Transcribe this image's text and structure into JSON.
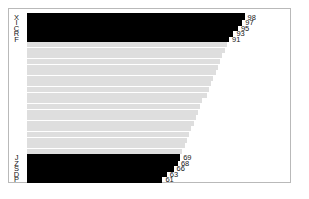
{
  "chart_data": {
    "type": "bar",
    "orientation": "horizontal",
    "title": "",
    "subtitle": "",
    "xlabel": "",
    "ylabel": "",
    "grid": false,
    "legend": null,
    "xlim": [
      0,
      98
    ],
    "categories": [
      "X",
      "I",
      "C",
      "R",
      "F",
      "J",
      "Z",
      "S",
      "D",
      "P"
    ],
    "values": [
      98,
      97,
      95,
      93,
      91,
      69,
      68,
      66,
      63,
      61
    ],
    "bars": [
      {
        "label": "X",
        "value": 98,
        "value_text": "98",
        "style": "solid"
      },
      {
        "label": "I",
        "value": 97,
        "value_text": "97",
        "style": "solid"
      },
      {
        "label": "C",
        "value": 95,
        "value_text": "95",
        "style": "solid"
      },
      {
        "label": "R",
        "value": 93,
        "value_text": "93",
        "style": "solid"
      },
      {
        "label": "F",
        "value": 91,
        "value_text": "91",
        "style": "solid"
      },
      {
        "label": "",
        "value": 90,
        "value_text": "",
        "style": "muted"
      },
      {
        "label": "",
        "value": 89,
        "value_text": "",
        "style": "muted"
      },
      {
        "label": "",
        "value": 88,
        "value_text": "",
        "style": "muted"
      },
      {
        "label": "",
        "value": 87,
        "value_text": "",
        "style": "muted"
      },
      {
        "label": "",
        "value": 86,
        "value_text": "",
        "style": "muted"
      },
      {
        "label": "",
        "value": 85,
        "value_text": "",
        "style": "muted"
      },
      {
        "label": "",
        "value": 84,
        "value_text": "",
        "style": "muted"
      },
      {
        "label": "",
        "value": 83,
        "value_text": "",
        "style": "muted"
      },
      {
        "label": "",
        "value": 82,
        "value_text": "",
        "style": "muted"
      },
      {
        "label": "",
        "value": 81,
        "value_text": "",
        "style": "muted"
      },
      {
        "label": "",
        "value": 79,
        "value_text": "",
        "style": "muted"
      },
      {
        "label": "",
        "value": 78,
        "value_text": "",
        "style": "muted"
      },
      {
        "label": "",
        "value": 77,
        "value_text": "",
        "style": "muted"
      },
      {
        "label": "",
        "value": 76,
        "value_text": "",
        "style": "muted"
      },
      {
        "label": "",
        "value": 75,
        "value_text": "",
        "style": "muted"
      },
      {
        "label": "",
        "value": 74,
        "value_text": "",
        "style": "muted"
      },
      {
        "label": "",
        "value": 73,
        "value_text": "",
        "style": "muted"
      },
      {
        "label": "",
        "value": 72,
        "value_text": "",
        "style": "muted"
      },
      {
        "label": "",
        "value": 71,
        "value_text": "",
        "style": "muted"
      },
      {
        "label": "",
        "value": 70,
        "value_text": "",
        "style": "muted"
      },
      {
        "label": "J",
        "value": 69,
        "value_text": "69",
        "style": "solid"
      },
      {
        "label": "Z",
        "value": 68,
        "value_text": "68",
        "style": "solid"
      },
      {
        "label": "S",
        "value": 66,
        "value_text": "66",
        "style": "solid"
      },
      {
        "label": "D",
        "value": 63,
        "value_text": "63",
        "style": "solid"
      },
      {
        "label": "P",
        "value": 61,
        "value_text": "61",
        "style": "solid"
      }
    ]
  },
  "colors": {
    "bar_solid": "#000000",
    "bar_muted": "#dedede",
    "text": "#161616",
    "frame": "#b9b9b9",
    "background": "#ffffff"
  },
  "layout": {
    "bar_left_px": 18,
    "row_height_px": 5.62,
    "px_per_unit": 2.22,
    "value_gap_px": 3
  }
}
